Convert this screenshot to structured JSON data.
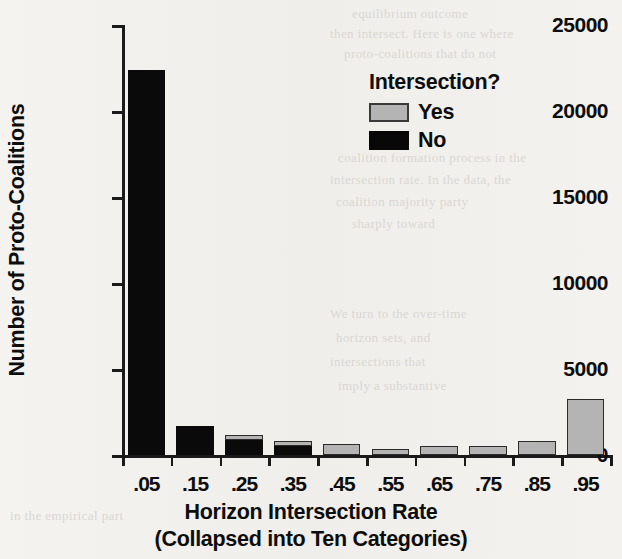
{
  "chart_data": {
    "type": "bar",
    "title": "",
    "xlabel": "Horizon Intersection Rate",
    "xlabel_sub": "(Collapsed into Ten Categories)",
    "ylabel": "Number of Proto-Coalitions",
    "categories": [
      ".05",
      ".15",
      ".25",
      ".35",
      ".45",
      ".55",
      ".65",
      ".75",
      ".85",
      ".95"
    ],
    "ylim": [
      0,
      25000
    ],
    "ytick_labels": [
      "0",
      "5000",
      "10000",
      "15000",
      "20000",
      "25000"
    ],
    "ytick_values": [
      0,
      5000,
      10000,
      15000,
      20000,
      25000
    ],
    "grid": false,
    "stacked": true,
    "legend_position": "top-right",
    "series": [
      {
        "name": "No",
        "color": "#0a0a0a",
        "values": [
          22400,
          1700,
          900,
          500,
          0,
          0,
          0,
          0,
          0,
          0
        ]
      },
      {
        "name": "Yes",
        "color": "#b4b4b4",
        "values": [
          0,
          0,
          250,
          300,
          650,
          350,
          550,
          500,
          800,
          3250
        ]
      }
    ]
  },
  "legend": {
    "title": "Intersection?",
    "entries": [
      {
        "label": "Yes",
        "swatch": "yes"
      },
      {
        "label": "No",
        "swatch": "no"
      }
    ]
  },
  "bleed_text": [
    "equilibrium outcome",
    "then intersect. Here is one where",
    "proto-coalitions that do not",
    "coalition formation process in the",
    "intersection rate. In the data, the",
    "coalition majority party",
    "sharply toward",
    "We turn to the over-time",
    "horizon sets, and",
    "intersections that",
    "imply a substantive",
    "in the empirical part"
  ]
}
